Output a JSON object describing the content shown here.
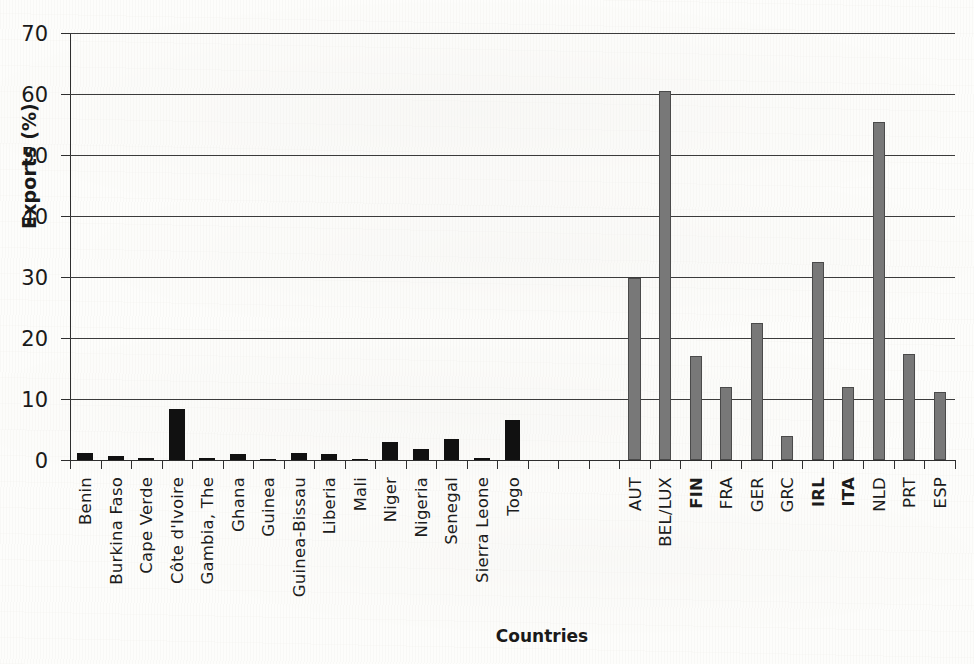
{
  "chart_data": {
    "type": "bar",
    "title": "",
    "xlabel": "Countries",
    "ylabel": "Exports (%)",
    "ylim": [
      0,
      70
    ],
    "ytick_labels": [
      "0",
      "10",
      "20",
      "30",
      "40",
      "50",
      "60",
      "70"
    ],
    "ytick_values": [
      0,
      10,
      20,
      30,
      40,
      50,
      60,
      70
    ],
    "grid": "horizontal",
    "legend": "none",
    "groups": [
      {
        "name": "West African countries",
        "color": "#111111",
        "categories": [
          "Benin",
          "Burkina Faso",
          "Cape Verde",
          "Côte d'Ivoire",
          "Gambia, The",
          "Ghana",
          "Guinea",
          "Guinea-Bissau",
          "Liberia",
          "Mali",
          "Niger",
          "Nigeria",
          "Senegal",
          "Sierra Leone",
          "Togo"
        ],
        "values": [
          1.2,
          0.7,
          0.3,
          8.3,
          0.3,
          1.0,
          0.2,
          1.2,
          1.0,
          0.2,
          3.0,
          1.8,
          3.4,
          0.3,
          6.5
        ],
        "bold_labels": []
      },
      {
        "name": "European countries",
        "color": "#787878",
        "categories": [
          "AUT",
          "BEL/LUX",
          "FIN",
          "FRA",
          "GER",
          "GRC",
          "IRL",
          "ITA",
          "NLD",
          "PRT",
          "ESP"
        ],
        "values": [
          29.8,
          60.5,
          17.0,
          12.0,
          22.4,
          4.0,
          32.5,
          12.0,
          55.4,
          17.3,
          11.2
        ],
        "bold_labels": [
          "FIN",
          "IRL",
          "ITA"
        ]
      }
    ]
  },
  "axes": {
    "y_title": "Exports (%)",
    "x_title": "Countries"
  }
}
